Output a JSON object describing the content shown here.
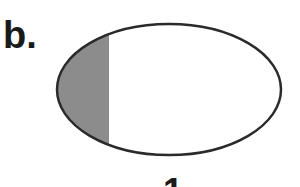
{
  "figure": {
    "panel_label": "b.",
    "bottom_label": "1",
    "ellipse": {
      "cx": 169,
      "cy": 89.5,
      "rx": 112,
      "ry": 65.5,
      "stroke": "#2a2a2a",
      "stroke_width": 2.5,
      "fill": "#ffffff"
    },
    "shaded_region": {
      "x_from": 57,
      "x_to": 109,
      "fill": "#8c8c8c",
      "description": "left segment of ellipse shaded gray"
    }
  }
}
